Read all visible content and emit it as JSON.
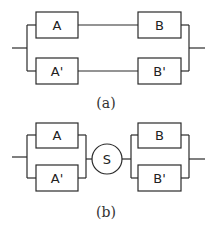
{
  "diagram_a": {
    "caption": "(a)",
    "blocks": {
      "top_left": "A",
      "bottom_left": "A'",
      "top_right": "B",
      "bottom_right": "B'"
    },
    "description": "Two parallel series branches: A–B and A'–B'"
  },
  "diagram_b": {
    "caption": "(b)",
    "blocks": {
      "top_left": "A",
      "bottom_left": "A'",
      "switch": "S",
      "top_right": "B",
      "bottom_right": "B'"
    },
    "description": "Parallel pair A/A' in series with switch S, then parallel pair B/B'"
  },
  "colors": {
    "line": "#2a2a2a",
    "background": "#ffffff"
  }
}
